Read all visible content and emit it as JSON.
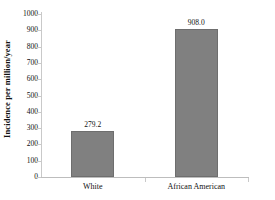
{
  "chart_data": {
    "type": "bar",
    "title": "",
    "subtitle": "",
    "xlabel": "",
    "ylabel": "Incidence per million/year",
    "categories": [
      "White",
      "African American"
    ],
    "values": [
      279.2,
      908.0
    ],
    "value_labels": [
      "279.2",
      "908.0"
    ],
    "ylim": [
      0,
      1000
    ],
    "ytick_step": 100,
    "yticks": [
      1000,
      900,
      800,
      700,
      600,
      500,
      400,
      300,
      200,
      100,
      0
    ],
    "ytick_labels": [
      "1000",
      "900",
      "800",
      "700",
      "600",
      "500",
      "400",
      "300",
      "200",
      "100",
      "0"
    ],
    "grid": false,
    "legend": false,
    "legend_position": "none",
    "series": [
      {
        "name": "Incidence",
        "values": [
          279.2,
          908.0
        ]
      }
    ],
    "colors": {
      "bar_fill": "#808080",
      "bar_border": "#6e6e6e",
      "axis_line": "#c9c9c9",
      "text": "#111111",
      "background": "#ffffff"
    }
  }
}
